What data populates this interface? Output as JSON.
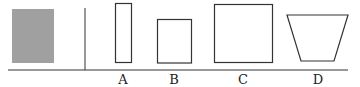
{
  "labels": {
    "a": "A",
    "b": "B",
    "c": "C",
    "d": "D"
  },
  "colors": {
    "shaded": "#a0a0a0",
    "stroke": "#333333"
  }
}
